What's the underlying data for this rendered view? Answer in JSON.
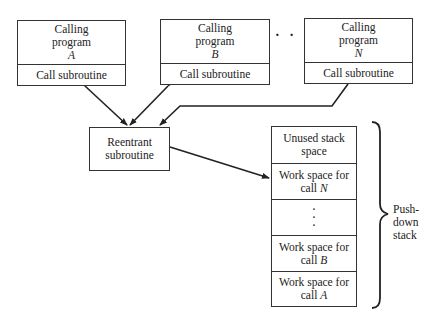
{
  "calling_programs": [
    {
      "line1": "Calling",
      "line2": "program",
      "name": "A",
      "action": "Call subroutine"
    },
    {
      "line1": "Calling",
      "line2": "program",
      "name": "B",
      "action": "Call subroutine"
    },
    {
      "line1": "Calling",
      "line2": "program",
      "name": "N",
      "action": "Call subroutine"
    }
  ],
  "ellipsis": "· · ·",
  "subroutine": {
    "line1": "Reentrant",
    "line2": "subroutine"
  },
  "stack": {
    "cells": [
      {
        "line1": "Unused stack",
        "line2": "space",
        "var": ""
      },
      {
        "line1": "Work space for",
        "line2": "call ",
        "var": "N"
      },
      {
        "line1": "·",
        "line2": "·",
        "var": "·"
      },
      {
        "line1": "Work space for",
        "line2": "call ",
        "var": "B"
      },
      {
        "line1": "Work space for",
        "line2": "call ",
        "var": "A"
      }
    ],
    "brace_label": {
      "line1": "Push-",
      "line2": "down",
      "line3": "stack"
    }
  }
}
